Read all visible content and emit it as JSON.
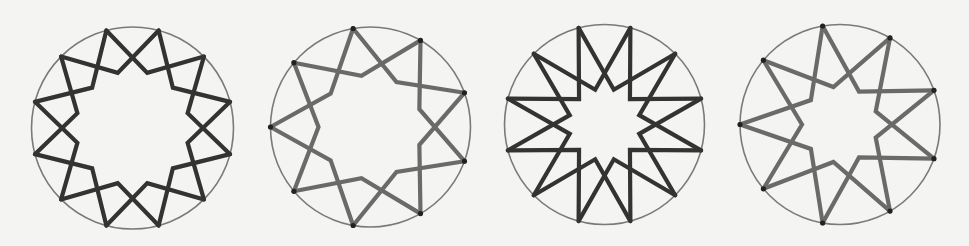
{
  "page": {
    "background": "#f4f4f2",
    "bleed_through_text_visible": true
  },
  "figures": [
    {
      "id": "fig-1",
      "points": 12,
      "start_angle_deg": -105,
      "cx": 132.5,
      "cy": 128,
      "r": 101,
      "elbow_ratio": 0.565,
      "stroke": "#333333",
      "stroke_width": 4.2,
      "circle_stroke": "#7a7a7a",
      "vertex_dots": false
    },
    {
      "id": "fig-2",
      "points": 9,
      "start_angle_deg": 180,
      "cx": 370.5,
      "cy": 127,
      "r": 100,
      "elbow_ratio": 0.52,
      "stroke": "#6a6a6a",
      "stroke_width": 4.2,
      "circle_stroke": "#7a7a7a",
      "vertex_dots": true
    },
    {
      "id": "fig-3",
      "points": 12,
      "start_angle_deg": -105,
      "cx": 604.5,
      "cy": 124.5,
      "r": 100,
      "elbow_ratio": 0.36,
      "stroke": "#333333",
      "stroke_width": 4.2,
      "circle_stroke": "#7a7a7a",
      "vertex_dots": false
    },
    {
      "id": "fig-4",
      "points": 9,
      "start_angle_deg": 180,
      "cx": 840,
      "cy": 124.5,
      "r": 100,
      "elbow_ratio": 0.38,
      "stroke": "#6a6a6a",
      "stroke_width": 4.2,
      "circle_stroke": "#7a7a7a",
      "vertex_dots": true
    }
  ]
}
